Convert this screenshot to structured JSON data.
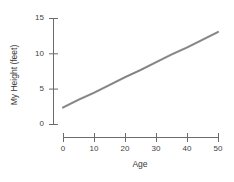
{
  "chart_data": {
    "type": "line",
    "title": "",
    "xlabel": "Age",
    "ylabel": "My Height (feet)",
    "xlim": [
      0,
      50
    ],
    "ylim": [
      0,
      15
    ],
    "grid": false,
    "legend": false,
    "xticks": [
      "0",
      "10",
      "20",
      "30",
      "40",
      "50"
    ],
    "xtick_values": [
      0,
      10,
      20,
      30,
      40,
      50
    ],
    "yticks": [
      "0",
      "5",
      "10",
      "15"
    ],
    "ytick_values": [
      0,
      5,
      10,
      15
    ],
    "series": [
      {
        "name": "My Height",
        "color": "#808080",
        "x": [
          0,
          5,
          10,
          15,
          20,
          25,
          30,
          35,
          40,
          45,
          50
        ],
        "values": [
          2.4,
          3.5,
          4.5,
          5.6,
          6.7,
          7.7,
          8.8,
          9.9,
          10.9,
          12.0,
          13.1
        ]
      }
    ]
  },
  "axes": {
    "x_title": "Age",
    "y_title": "My Height (feet)",
    "x_labels": [
      "0",
      "10",
      "20",
      "30",
      "40",
      "50"
    ],
    "y_labels": [
      "15",
      "10",
      "5",
      "0"
    ]
  },
  "colors": {
    "line": "#808080",
    "axis": "#6b6b6b",
    "text": "#3a3a3a",
    "background": "#ffffff"
  }
}
